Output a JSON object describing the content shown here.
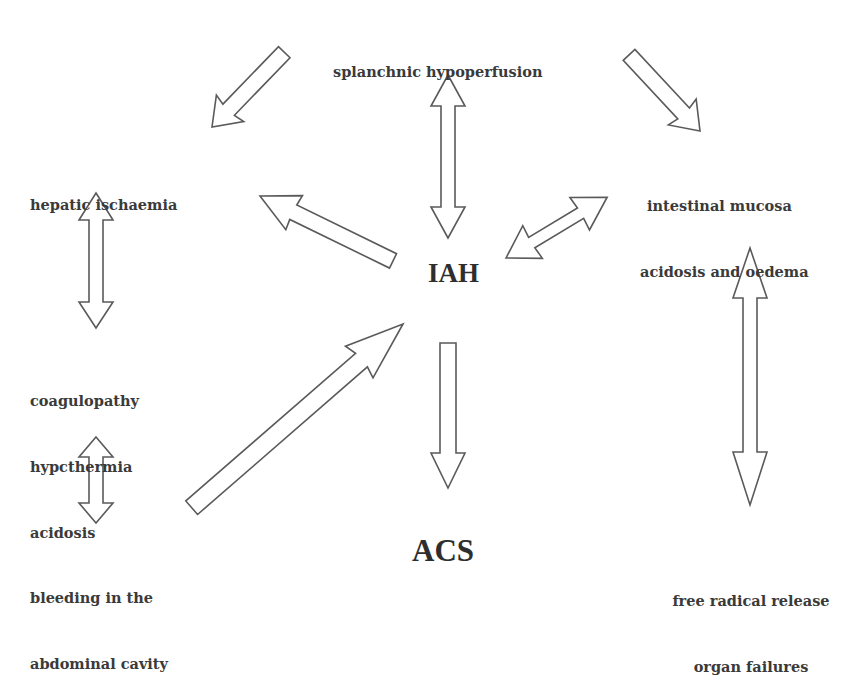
{
  "diagram": {
    "central_nodes": {
      "iah": "IAH",
      "acs": "ACS"
    },
    "nodes": {
      "splanchnic": {
        "lines": [
          "splanchnic hypoperfusion"
        ]
      },
      "hepatic": {
        "lines": [
          "hepatic ischaemia"
        ]
      },
      "intestinal": {
        "lines": [
          "intestinal mucosa",
          "acidosis and oedema"
        ]
      },
      "coagulopathy": {
        "lines": [
          "coagulopathy",
          "hypcthermia",
          "acidosis"
        ]
      },
      "bleeding": {
        "lines": [
          "bleeding in the",
          "abdominal cavity"
        ]
      },
      "free_radical": {
        "lines": [
          "free radical release",
          "organ failures"
        ]
      }
    },
    "edges": [
      {
        "from": "splanchnic hypoperfusion",
        "to": "hepatic ischaemia",
        "type": "single"
      },
      {
        "from": "splanchnic hypoperfusion",
        "to": "IAH",
        "type": "double"
      },
      {
        "from": "splanchnic hypoperfusion",
        "to": "intestinal mucosa acidosis and oedema",
        "type": "single"
      },
      {
        "from": "IAH",
        "to": "hepatic ischaemia",
        "type": "single"
      },
      {
        "from": "IAH",
        "to": "intestinal mucosa acidosis and oedema",
        "type": "double"
      },
      {
        "from": "hepatic ischaemia",
        "to": "coagulopathy hypcthermia acidosis",
        "type": "double"
      },
      {
        "from": "bleeding in the abdominal cavity",
        "to": "IAH",
        "type": "single"
      },
      {
        "from": "IAH",
        "to": "ACS",
        "type": "single"
      },
      {
        "from": "intestinal mucosa acidosis and oedema",
        "to": "free radical release organ failures",
        "type": "double"
      },
      {
        "from": "coagulopathy hypcthermia acidosis",
        "to": "bleeding in the abdominal cavity",
        "type": "double"
      }
    ],
    "colors": {
      "background": "#ffffff",
      "text": "#3a3a3a",
      "arrow_outline": "#5a5a5a",
      "arrow_fill": "#ffffff"
    }
  }
}
